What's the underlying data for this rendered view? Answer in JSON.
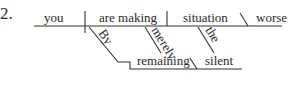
{
  "diagram": {
    "number": "2.",
    "subject": "you",
    "verb": "are making",
    "object": "situation",
    "object_complement": "worse",
    "modifiers": {
      "verb_prep": "By",
      "verb_adverb": "merely",
      "object_article": "the"
    },
    "gerund_phrase": {
      "gerund": "remaining",
      "complement": "silent"
    },
    "colors": {
      "ink": "#333333",
      "background": "#ffffff"
    }
  }
}
